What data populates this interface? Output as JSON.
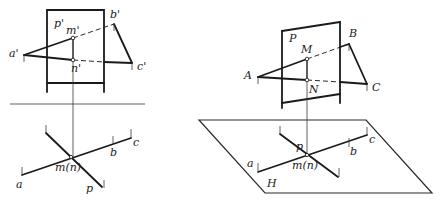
{
  "diagram": {
    "type": "descriptive-geometry-projection",
    "left_view": {
      "plane_label": "p'",
      "triangle_labels": {
        "a": "a'",
        "b": "b'",
        "c": "c'"
      },
      "intersection_labels": {
        "m": "m'",
        "n": "n'"
      },
      "plan": {
        "labels": {
          "a": "a",
          "b": "b",
          "c": "c",
          "p": "p",
          "mn": "m(n)"
        }
      }
    },
    "right_view": {
      "plane_label": "P",
      "triangle_labels": {
        "a": "A",
        "b": "B",
        "c": "C"
      },
      "intersection_labels": {
        "m": "M",
        "n": "N"
      },
      "ground_plane_label": "H",
      "plan": {
        "labels": {
          "a": "a",
          "b": "b",
          "c": "c",
          "p": "p",
          "mn": "m(n)"
        }
      }
    },
    "colors": {
      "line": "#1a1a1a",
      "background": "#ffffff"
    }
  }
}
